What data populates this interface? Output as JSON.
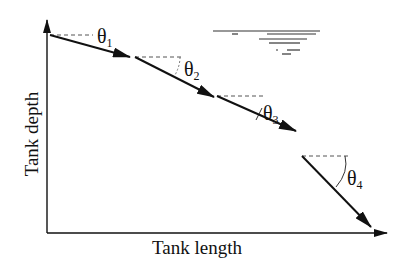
{
  "diagram": {
    "x_axis_label": "Tank length",
    "y_axis_label": "Tank depth",
    "angles": [
      {
        "symbol": "θ",
        "subscript": "1"
      },
      {
        "symbol": "θ",
        "subscript": "2"
      },
      {
        "symbol": "θ",
        "subscript": "3"
      },
      {
        "symbol": "θ",
        "subscript": "4"
      }
    ],
    "elements": {
      "trajectory_segments": 4,
      "water_surface_symbol": true
    },
    "colors": {
      "line": "#111111",
      "dashed": "#555555",
      "background": "#ffffff"
    }
  }
}
